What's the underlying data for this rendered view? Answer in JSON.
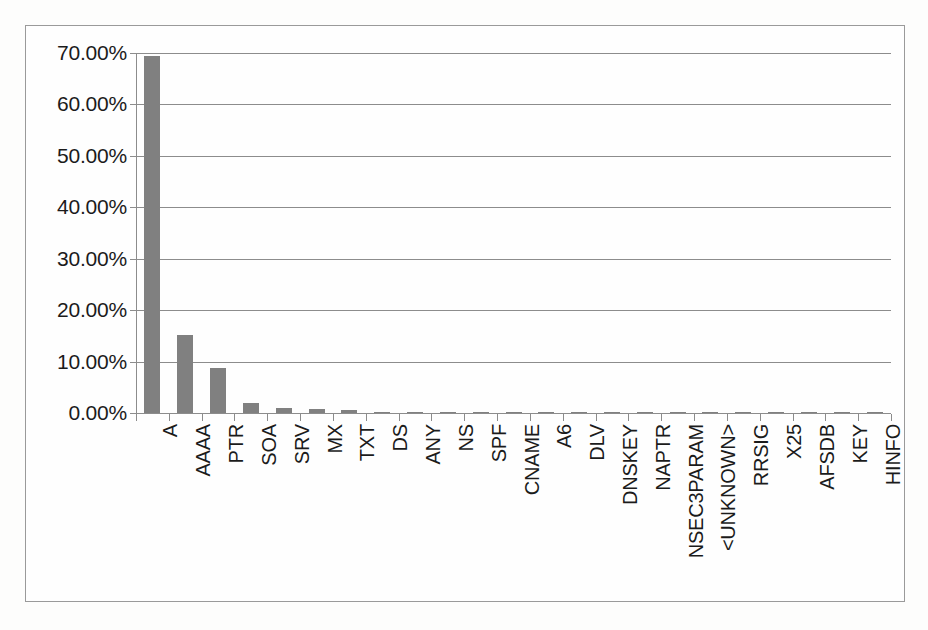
{
  "chart_data": {
    "type": "bar",
    "title": "",
    "subtitle": "",
    "xlabel": "",
    "ylabel": "",
    "ylim": [
      0,
      70
    ],
    "grid": true,
    "legend": false,
    "legend_position": "none",
    "value_suffix": "%",
    "bar_color": "#808080",
    "axis_color": "#8c8c8c",
    "text_color": "#1b1b1b",
    "ytick_labels": [
      "70.00%",
      "60.00%",
      "50.00%",
      "40.00%",
      "30.00%",
      "20.00%",
      "10.00%",
      "0.00%"
    ],
    "ytick_values": [
      70,
      60,
      50,
      40,
      30,
      20,
      10,
      0
    ],
    "categories": [
      "A",
      "AAAA",
      "PTR",
      "SOA",
      "SRV",
      "MX",
      "TXT",
      "DS",
      "ANY",
      "NS",
      "SPF",
      "CNAME",
      "A6",
      "DLV",
      "DNSKEY",
      "NAPTR",
      "NSEC3PARAM",
      "<UNKNOWN>",
      "RRSIG",
      "X25",
      "AFSDB",
      "KEY",
      "HINFO"
    ],
    "values": [
      69.5,
      15.2,
      8.7,
      2.0,
      1.05,
      0.8,
      0.65,
      0.2,
      0.12,
      0.06,
      0.04,
      0.03,
      0.02,
      0.02,
      0.02,
      0.01,
      0.01,
      0.01,
      0.01,
      0.01,
      0.01,
      0.01,
      0.01
    ]
  }
}
